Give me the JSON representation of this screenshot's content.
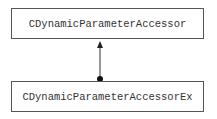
{
  "diagram": {
    "type": "class-inheritance",
    "nodes": [
      {
        "id": "base",
        "label": "CDynamicParameterAccessor"
      },
      {
        "id": "derived",
        "label": "CDynamicParameterAccessorEx"
      }
    ],
    "edges": [
      {
        "from": "derived",
        "to": "base",
        "style": "arrow-with-dot-origin"
      }
    ],
    "colors": {
      "stroke": "#333333",
      "background": "#ffffff"
    }
  }
}
